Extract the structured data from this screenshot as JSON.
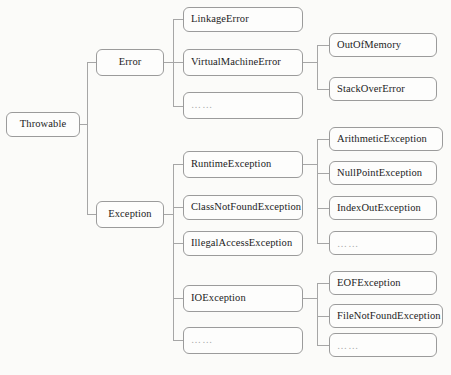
{
  "diagram": {
    "type": "tree",
    "background_color": "#fbfbf9",
    "box_border_color": "#9b9b9b",
    "connector_color": "#a6a6a6",
    "text_color": "#1c1c1c",
    "ellipsis_text": "……",
    "nodes": {
      "root": {
        "label": "Throwable"
      },
      "level1": [
        {
          "label": "Error"
        },
        {
          "label": "Exception"
        }
      ],
      "error_children": [
        {
          "label": "LinkageError"
        },
        {
          "label": "VirtualMachineError"
        },
        {
          "label": "……"
        }
      ],
      "virtualmachineerror_children": [
        {
          "label": "OutOfMemory"
        },
        {
          "label": "StackOverError"
        }
      ],
      "exception_children": [
        {
          "label": "RuntimeException"
        },
        {
          "label": "ClassNotFoundException"
        },
        {
          "label": "IllegalAccessException"
        },
        {
          "label": "IOException"
        },
        {
          "label": "……"
        }
      ],
      "runtimeexception_children": [
        {
          "label": "ArithmeticException"
        },
        {
          "label": "NullPointException"
        },
        {
          "label": "IndexOutException"
        },
        {
          "label": "……"
        }
      ],
      "ioexception_children": [
        {
          "label": "EOFException"
        },
        {
          "label": "FileNotFoundException"
        },
        {
          "label": "……"
        }
      ]
    }
  }
}
